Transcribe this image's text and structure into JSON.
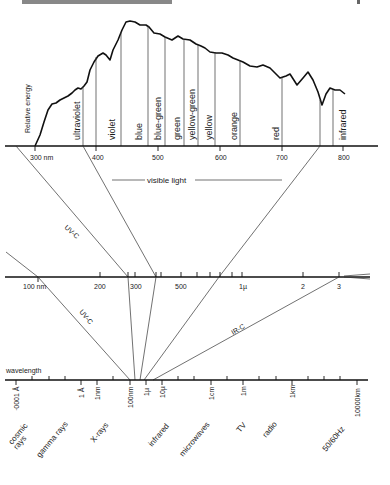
{
  "header": {
    "running_title": "",
    "page_number": ""
  },
  "colors": {
    "ink": "#111111",
    "background": "#ffffff"
  },
  "top_panel": {
    "y_axis_label": "Relative energy",
    "axis_unit_first": "300 nm",
    "ticks": [
      "300 nm",
      "400",
      "500",
      "600",
      "700",
      "800"
    ],
    "bands": [
      "ultraviolet",
      "violet",
      "blue",
      "blue-green",
      "green",
      "yellow-green",
      "yellow",
      "orange",
      "red",
      "infrared"
    ],
    "visible_light_label": "visible light"
  },
  "middle_panel": {
    "ticks": [
      "100 nm",
      "200",
      "300",
      "500",
      "1µ",
      "2",
      "3"
    ],
    "uv_c_label_upper": "UV-C",
    "uv_c_label_lower": "UV-C",
    "ir_c_label": "IR-C"
  },
  "bottom_panel": {
    "axis_label": "wavelength",
    "ticks": [
      "·0001 Å",
      "1 Å",
      "1nm",
      "100nm",
      "1µ",
      "10µ",
      "1cm",
      "1m",
      "1km",
      "10000km"
    ],
    "regions": [
      "cosmic rays",
      "gamma rays",
      "X-rays",
      "infrared",
      "microwaves",
      "TV",
      "radio",
      "50/60Hz"
    ]
  }
}
